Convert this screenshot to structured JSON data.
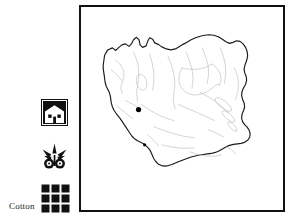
{
  "figure": {
    "caption": "Cotton",
    "background_color": "#ffffff"
  },
  "legend_icons": [
    {
      "name": "house-icon",
      "semantic": "settlement-architecture-pictogram",
      "description": "Filled dark square containing a white house silhouette with two small dark windows",
      "color": "#111111"
    },
    {
      "name": "cotton-boll-icon",
      "semantic": "cotton-boll-pictogram",
      "description": "Symmetric dark emblem with spreading bracts and two round bolls",
      "color": "#111111"
    },
    {
      "name": "weave-grid-icon",
      "semantic": "textile-weave-pictogram",
      "description": "Three by three grid of dark squares representing woven cloth",
      "color": "#111111",
      "rows": 3,
      "columns": 3
    }
  ],
  "map": {
    "name": "iran-outline-map",
    "border_color": "#111111",
    "land_fill": "#ffffff",
    "outline_color": "#1b1b1b",
    "interior_line_color": "#bdbdbd",
    "site_marker_color": "#000000",
    "site_markers": [
      {
        "label": "",
        "cx": 57,
        "cy": 101,
        "r": 2.6
      },
      {
        "label": "",
        "cx": 63,
        "cy": 136,
        "r": 1.6
      }
    ]
  }
}
